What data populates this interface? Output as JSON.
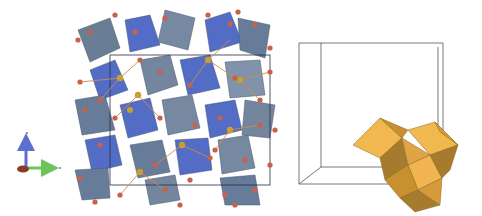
{
  "figure": {
    "panels": [
      {
        "id": "axes",
        "description": "coordinate axes triad",
        "axes": [
          {
            "name": "c",
            "direction": "up",
            "color": "#5b6fd0"
          },
          {
            "name": "b",
            "direction": "right",
            "color": "#6cc35a"
          },
          {
            "name": "a",
            "direction": "out-of-page",
            "color": "#8a3a2a"
          }
        ]
      },
      {
        "id": "crystal-structure",
        "description": "polyhedral crystal structure with blue-grey octahedra, red oxygen atoms and gold cations",
        "colors": {
          "polyhedra_dark": "#5f7593",
          "polyhedra_blue": "#4a66c4",
          "polyhedra_light": "#9aaecb",
          "oxygen": "#c8604a",
          "bond": "#d08a4a",
          "cation": "#c9a030",
          "cell_edge": "#2a2f45"
        }
      },
      {
        "id": "unit-cell",
        "description": "unit cell wireframe with cluster of gold polyhedra at lower right",
        "colors": {
          "frame": "#555555",
          "poly_light": "#f2b850",
          "poly_mid": "#d69a38",
          "poly_dark": "#a77b2e"
        }
      }
    ]
  }
}
